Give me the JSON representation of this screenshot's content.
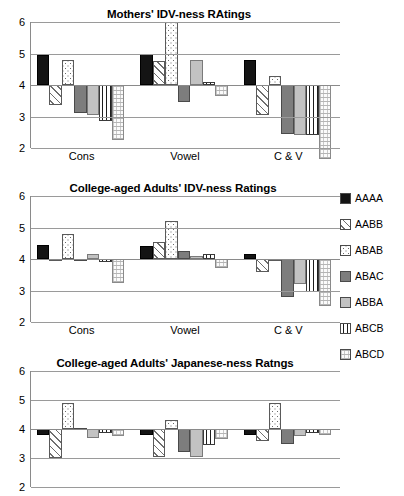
{
  "series_keys": [
    "AAAA",
    "AABB",
    "ABAB",
    "ABAC",
    "ABBA",
    "ABCB",
    "ABCD"
  ],
  "legend": {
    "position": "right",
    "items": [
      {
        "label": "AAAA",
        "pattern": "solid-black",
        "color": "#141414"
      },
      {
        "label": "AABB",
        "pattern": "diagonal-hatch",
        "color": "#6f6f6f"
      },
      {
        "label": "ABAB",
        "pattern": "dots",
        "color": "#6a6a6a"
      },
      {
        "label": "ABAC",
        "pattern": "solid-dark-gray",
        "color": "#7d7d7d"
      },
      {
        "label": "ABBA",
        "pattern": "solid-light-gray",
        "color": "#c2c2c2"
      },
      {
        "label": "ABCB",
        "pattern": "vertical-lines",
        "color": "#1d1d1d"
      },
      {
        "label": "ABCD",
        "pattern": "wavy",
        "color": "#b5b5b5"
      }
    ]
  },
  "charts": [
    {
      "id": "mothers-idv-ness",
      "title": "Mothers' IDV-ness RAtings",
      "show_xlabels": true,
      "categories": [
        "Cons",
        "Vowel",
        "C & V"
      ],
      "yticks": [
        6,
        5,
        4,
        3,
        2
      ],
      "ylim": [
        2,
        6
      ],
      "baseline": 4,
      "series": [
        {
          "name": "AAAA",
          "values": [
            4.95,
            5.0,
            4.8
          ]
        },
        {
          "name": "AABB",
          "values": [
            3.35,
            4.75,
            3.05
          ]
        },
        {
          "name": "ABAB",
          "values": [
            4.8,
            6.0,
            4.3
          ]
        },
        {
          "name": "ABAC",
          "values": [
            3.1,
            3.45,
            2.45
          ]
        },
        {
          "name": "ABBA",
          "values": [
            3.05,
            4.8,
            2.4
          ]
        },
        {
          "name": "ABCB",
          "values": [
            2.85,
            4.1,
            2.4
          ]
        },
        {
          "name": "ABCD",
          "values": [
            2.25,
            3.65,
            1.65
          ]
        }
      ]
    },
    {
      "id": "college-adults-idv-ness",
      "title": "College-aged Adults' IDV-ness Ratings",
      "show_xlabels": true,
      "categories": [
        "Cons",
        "Vowel",
        "C & V"
      ],
      "yticks": [
        6,
        5,
        4,
        3,
        2
      ],
      "ylim": [
        2,
        6
      ],
      "baseline": 4,
      "series": [
        {
          "name": "AAAA",
          "values": [
            4.45,
            4.4,
            4.15
          ]
        },
        {
          "name": "AABB",
          "values": [
            4.0,
            4.55,
            3.6
          ]
        },
        {
          "name": "ABAB",
          "values": [
            4.8,
            5.2,
            3.95
          ]
        },
        {
          "name": "ABAC",
          "values": [
            3.98,
            4.25,
            2.8
          ]
        },
        {
          "name": "ABBA",
          "values": [
            4.15,
            4.1,
            3.2
          ]
        },
        {
          "name": "ABCB",
          "values": [
            3.9,
            4.15,
            2.95
          ]
        },
        {
          "name": "ABCD",
          "values": [
            3.25,
            3.7,
            2.5
          ]
        }
      ]
    },
    {
      "id": "college-adults-japanese-ness",
      "title": "College-aged Adults' Japanese-ness Ratngs",
      "show_xlabels": false,
      "categories": [
        "Cons",
        "Vowel",
        "C & V"
      ],
      "yticks": [
        6,
        5,
        4,
        3,
        2
      ],
      "ylim": [
        2,
        6
      ],
      "baseline": 4,
      "series": [
        {
          "name": "AAAA",
          "values": [
            3.8,
            3.8,
            3.8
          ]
        },
        {
          "name": "AABB",
          "values": [
            3.0,
            3.05,
            3.6
          ]
        },
        {
          "name": "ABAB",
          "values": [
            4.9,
            4.3,
            4.9
          ]
        },
        {
          "name": "ABAC",
          "values": [
            4.05,
            3.2,
            3.5
          ]
        },
        {
          "name": "ABBA",
          "values": [
            3.7,
            3.05,
            3.75
          ]
        },
        {
          "name": "ABCB",
          "values": [
            3.85,
            3.45,
            3.85
          ]
        },
        {
          "name": "ABCD",
          "values": [
            3.75,
            3.65,
            3.8
          ]
        }
      ]
    }
  ],
  "chart_data": {
    "type": "bar",
    "xlabel": "",
    "ylabel": "",
    "ylim": [
      2,
      6
    ],
    "grid": true,
    "legend_position": "right",
    "categories": [
      "Cons",
      "Vowel",
      "C & V"
    ],
    "panels": [
      {
        "title": "Mothers' IDV-ness RAtings",
        "series": [
          {
            "name": "AAAA",
            "values": [
              4.95,
              5.0,
              4.8
            ]
          },
          {
            "name": "AABB",
            "values": [
              3.35,
              4.75,
              3.05
            ]
          },
          {
            "name": "ABAB",
            "values": [
              4.8,
              6.0,
              4.3
            ]
          },
          {
            "name": "ABAC",
            "values": [
              3.1,
              3.45,
              2.45
            ]
          },
          {
            "name": "ABBA",
            "values": [
              3.05,
              4.8,
              2.4
            ]
          },
          {
            "name": "ABCB",
            "values": [
              2.85,
              4.1,
              2.4
            ]
          },
          {
            "name": "ABCD",
            "values": [
              2.25,
              3.65,
              1.65
            ]
          }
        ]
      },
      {
        "title": "College-aged Adults' IDV-ness Ratings",
        "series": [
          {
            "name": "AAAA",
            "values": [
              4.45,
              4.4,
              4.15
            ]
          },
          {
            "name": "AABB",
            "values": [
              4.0,
              4.55,
              3.6
            ]
          },
          {
            "name": "ABAB",
            "values": [
              4.8,
              5.2,
              3.95
            ]
          },
          {
            "name": "ABAC",
            "values": [
              3.98,
              4.25,
              2.8
            ]
          },
          {
            "name": "ABBA",
            "values": [
              4.15,
              4.1,
              3.2
            ]
          },
          {
            "name": "ABCB",
            "values": [
              3.9,
              4.15,
              2.95
            ]
          },
          {
            "name": "ABCD",
            "values": [
              3.25,
              3.7,
              2.5
            ]
          }
        ]
      },
      {
        "title": "College-aged Adults' Japanese-ness Ratngs",
        "series": [
          {
            "name": "AAAA",
            "values": [
              3.8,
              3.8,
              3.8
            ]
          },
          {
            "name": "AABB",
            "values": [
              3.0,
              3.05,
              3.6
            ]
          },
          {
            "name": "ABAB",
            "values": [
              4.9,
              4.3,
              4.9
            ]
          },
          {
            "name": "ABAC",
            "values": [
              4.05,
              3.2,
              3.5
            ]
          },
          {
            "name": "ABBA",
            "values": [
              3.7,
              3.05,
              3.75
            ]
          },
          {
            "name": "ABCB",
            "values": [
              3.85,
              3.45,
              3.85
            ]
          },
          {
            "name": "ABCD",
            "values": [
              3.75,
              3.65,
              3.8
            ]
          }
        ]
      }
    ],
    "baseline": 4,
    "note": "Bars are drawn from a baseline of 4; values above 4 extend upward, values below 4 extend downward."
  }
}
